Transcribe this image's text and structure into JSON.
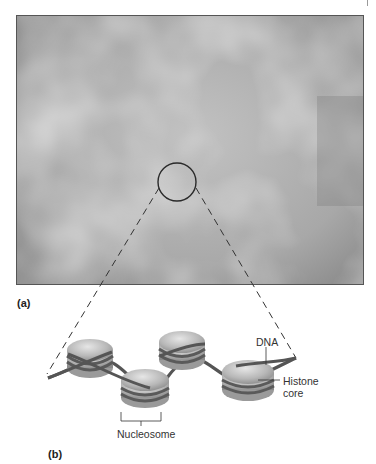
{
  "figure": {
    "panel_a": {
      "label": "(a)",
      "image": "electron-micrograph-chromatin",
      "magnifier": "circle-highlight"
    },
    "panel_b": {
      "label": "(b)",
      "labels": {
        "dna": "DNA",
        "histone_line1": "Histone",
        "histone_line2": "core",
        "nucleosome": "Nucleosome"
      }
    },
    "colors": {
      "micrograph_base": "#a4a4a4",
      "histone_fill": "#bdbdbd",
      "dna_strand": "#5a5a5a",
      "leader_lines": "#333333"
    }
  }
}
